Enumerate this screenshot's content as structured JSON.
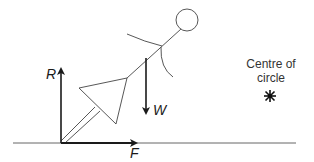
{
  "diagram": {
    "labels": {
      "reaction": "R",
      "friction": "F",
      "weight": "W",
      "centre_line1": "Centre of",
      "centre_line2": "circle"
    },
    "colors": {
      "line": "#333333",
      "arrow": "#1a1a1a",
      "ground": "#555555"
    }
  }
}
